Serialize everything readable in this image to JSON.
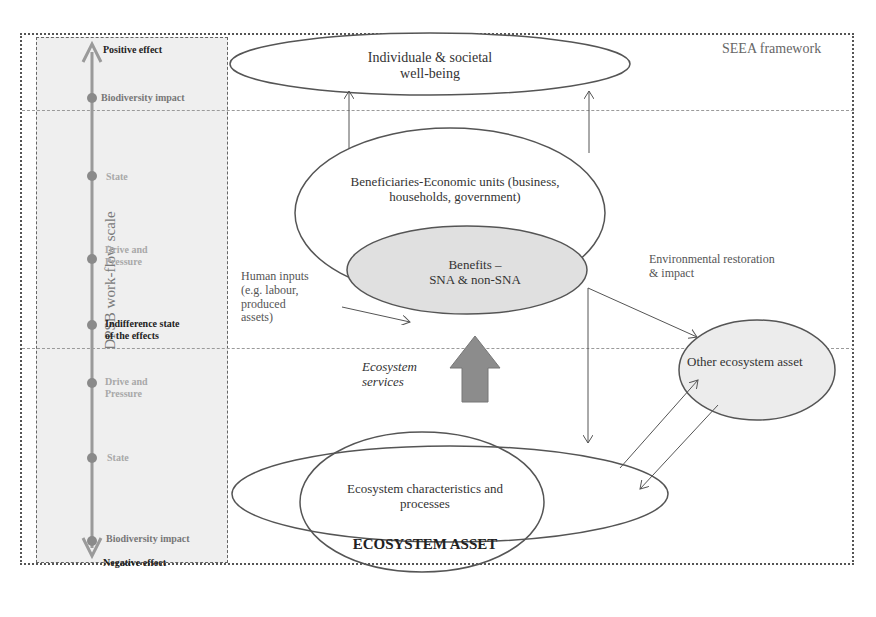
{
  "framework": {
    "label": "SEEA framework"
  },
  "scale": {
    "title": "DPSB work-flow scale",
    "items": [
      {
        "label": "Positive effect",
        "tone": "dark"
      },
      {
        "label": "Biodiversity impact",
        "tone": "mid"
      },
      {
        "label": "State",
        "tone": "light"
      },
      {
        "label": "Drive and\nPressure",
        "tone": "light",
        "line1": "Drive and",
        "line2": "Pressure"
      },
      {
        "label": "Indifference state of the effects",
        "tone": "dark",
        "line1": "Indifference state",
        "line2": "of the effects"
      },
      {
        "label": "Drive and\nPressure",
        "tone": "light",
        "line1": "Drive and",
        "line2": "Pressure"
      },
      {
        "label": "State",
        "tone": "light"
      },
      {
        "label": "Biodiversity impact",
        "tone": "mid"
      },
      {
        "label": "Negative effect",
        "tone": "dark"
      }
    ]
  },
  "nodes": {
    "wellbeing": {
      "line1": "Individuale & societal",
      "line2": "well-being"
    },
    "beneficiaries": {
      "line1": "Beneficiaries-Economic units (business,",
      "line2": "households, government)"
    },
    "benefits": {
      "line1": "Benefits –",
      "line2": "SNA & non-SNA"
    },
    "other_asset": {
      "label": "Other ecosystem asset"
    },
    "characteristics": {
      "line1": "Ecosystem characteristics and",
      "line2": "processes"
    },
    "ecosystem_asset": {
      "label": "ECOSYSTEM ASSET"
    }
  },
  "annotations": {
    "human_inputs": {
      "line1": "Human inputs",
      "line2": "(e.g. labour,",
      "line3": "produced",
      "line4": "assets)"
    },
    "ecosystem_services": {
      "line1": "Ecosystem",
      "line2": "services"
    },
    "restoration": {
      "line1": "Environmental restoration",
      "line2": "& impact"
    }
  },
  "colors": {
    "benefits_fill": "#e0e0e0",
    "other_asset_fill": "#ececec",
    "services_arrow": "#8c8c8c",
    "scale_axis": "#9a9a9a",
    "scale_panel": "#efefef"
  }
}
